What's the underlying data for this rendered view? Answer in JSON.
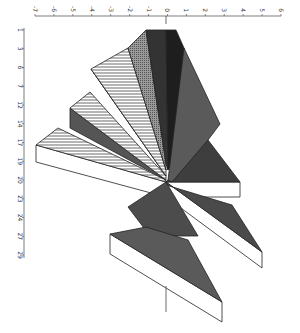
{
  "chart_data": {
    "type": "area",
    "title": "",
    "orientation": "rotated-90",
    "style": "3D polar fan / radial triangles",
    "xlabel": "",
    "ylabel": "",
    "value_axis": {
      "position": "top",
      "ticks": [
        -7,
        -6,
        -5,
        -4,
        -3,
        -2,
        -1,
        0,
        1,
        2,
        3,
        4,
        5,
        6
      ],
      "range": [
        -7,
        6
      ]
    },
    "category_axis": {
      "position": "left",
      "ticks": [
        "1",
        "3",
        "6",
        "7",
        "12",
        "14",
        "17",
        "19",
        "20",
        "23",
        "24",
        "27",
        "29"
      ]
    },
    "segments": [
      {
        "label": "seg-1",
        "fill": "#3a3a3a",
        "pattern": "solid-dark",
        "approx_extent": [
          -0.3,
          0.6
        ]
      },
      {
        "label": "seg-2",
        "fill": "#1e1e1e",
        "pattern": "solid-black",
        "approx_extent": [
          0,
          1.0
        ]
      },
      {
        "label": "seg-3",
        "fill": "#888888",
        "pattern": "dotted-gray",
        "approx_extent": [
          -1.1,
          0
        ]
      },
      {
        "label": "seg-4",
        "fill": "#ffffff",
        "pattern": "horizontal-stripes",
        "approx_extent": [
          -3.0,
          0
        ]
      },
      {
        "label": "seg-5",
        "fill": "#ffffff",
        "pattern": "horizontal-stripes",
        "approx_extent": [
          -4.0,
          0
        ]
      },
      {
        "label": "seg-6",
        "fill": "#ffffff",
        "pattern": "horizontal-stripes",
        "approx_extent": [
          -6.5,
          0
        ]
      },
      {
        "label": "seg-7",
        "fill": "#555555",
        "pattern": "solid-gray",
        "approx_extent": [
          0,
          2.7
        ]
      },
      {
        "label": "seg-8",
        "fill": "#3c3c3c",
        "pattern": "solid-dark",
        "approx_extent": [
          0,
          3.9
        ]
      },
      {
        "label": "seg-9",
        "fill": "#4a4a4a",
        "pattern": "solid-dark",
        "approx_extent": [
          -2.0,
          1.7
        ]
      },
      {
        "label": "seg-10",
        "fill": "#505050",
        "pattern": "solid-dark",
        "approx_extent": [
          -3.0,
          4.0
        ]
      },
      {
        "label": "seg-11",
        "fill": "#585858",
        "pattern": "solid-dark",
        "approx_extent": [
          -3.0,
          2.0
        ]
      }
    ],
    "grid": false,
    "legend": null
  }
}
